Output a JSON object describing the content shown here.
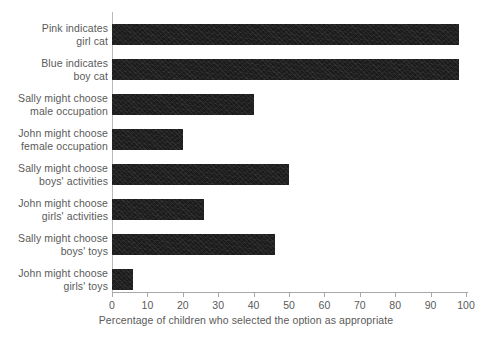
{
  "chart_data": {
    "type": "bar",
    "orientation": "horizontal",
    "title": "",
    "xlabel": "Percentage of children who selected the option as appropriate",
    "ylabel": "",
    "xlim": [
      0,
      100
    ],
    "xticks": [
      0,
      10,
      20,
      30,
      40,
      50,
      60,
      70,
      80,
      90,
      100
    ],
    "grid": false,
    "legend": "none",
    "bar_color": "#1b1b1b",
    "axis_color": "#a8a8a8",
    "text_color": "#5a5a5a",
    "categories": [
      "Pink indicates girl cat",
      "Blue indicates boy cat",
      "Sally might choose male occupation",
      "John might choose female occupation",
      "Sally might choose boys' activities",
      "John might choose girls' activities",
      "Sally might choose boys' toys",
      "John might choose girls' toys"
    ],
    "category_lines": [
      [
        "Pink indicates",
        "girl cat"
      ],
      [
        "Blue indicates",
        "boy cat"
      ],
      [
        "Sally might choose",
        "male occupation"
      ],
      [
        "John might choose",
        "female occupation"
      ],
      [
        "Sally might choose",
        "boys' activities"
      ],
      [
        "John might choose",
        "girls' activities"
      ],
      [
        "Sally might choose",
        "boys' toys"
      ],
      [
        "John might choose",
        "girls' toys"
      ]
    ],
    "values": [
      98,
      98,
      40,
      20,
      50,
      26,
      46,
      6
    ]
  }
}
